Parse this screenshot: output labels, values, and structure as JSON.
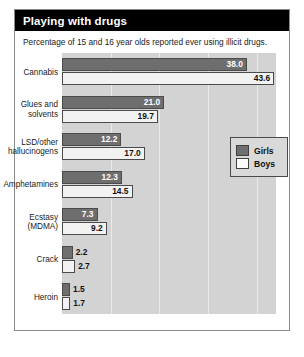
{
  "header": {
    "title": "Playing with drugs"
  },
  "subtitle": "Percentage of 15 and 16 year olds reported ever using illicit drugs.",
  "legend": {
    "items": [
      {
        "label": "Girls",
        "color": "#6e6e6e"
      },
      {
        "label": "Boys",
        "color": "#fbfbfb"
      }
    ]
  },
  "chart_data": {
    "type": "bar",
    "orientation": "horizontal",
    "title": "Playing with drugs",
    "subtitle": "Percentage of 15 and 16 year olds reported ever using illicit drugs.",
    "xlabel": "",
    "ylabel": "",
    "xlim": [
      0,
      44
    ],
    "grid": true,
    "legend_position": "center-right",
    "categories": [
      "Cannabis",
      "Glues and solvents",
      "LSD/other hallucinogens",
      "Amphetamines",
      "Ecstasy (MDMA)",
      "Crack",
      "Heroin"
    ],
    "category_lines": [
      [
        "Cannabis"
      ],
      [
        "Glues and",
        "solvents"
      ],
      [
        "LSD/other",
        "hallucinogens"
      ],
      [
        "Amphetamines"
      ],
      [
        "Ecstasy",
        "(MDMA)"
      ],
      [
        "Crack"
      ],
      [
        "Heroin"
      ]
    ],
    "series": [
      {
        "name": "Girls",
        "color": "#6e6e6e",
        "values": [
          38.0,
          21.0,
          12.2,
          12.3,
          7.3,
          2.2,
          1.5
        ]
      },
      {
        "name": "Boys",
        "color": "#fbfbfb",
        "values": [
          43.6,
          19.7,
          17.0,
          14.5,
          9.2,
          2.7,
          1.7
        ]
      }
    ],
    "value_labels": {
      "girls": [
        "38.0",
        "21.0",
        "12.2",
        "12.3",
        "7.3",
        "2.2",
        "1.5"
      ],
      "boys": [
        "43.6",
        "19.7",
        "17.0",
        "14.5",
        "9.2",
        "2.7",
        "1.7"
      ]
    }
  }
}
